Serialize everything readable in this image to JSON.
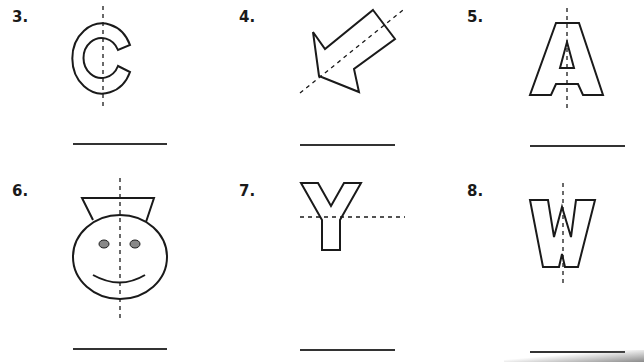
{
  "worksheet": {
    "problems": [
      {
        "number": "3.",
        "figure": "letter-C",
        "line_of_symmetry": "vertical"
      },
      {
        "number": "4.",
        "figure": "arrow",
        "line_of_symmetry": "diagonal"
      },
      {
        "number": "5.",
        "figure": "letter-A",
        "line_of_symmetry": "vertical"
      },
      {
        "number": "6.",
        "figure": "face-with-hat",
        "line_of_symmetry": "vertical"
      },
      {
        "number": "7.",
        "figure": "letter-Y",
        "line_of_symmetry": "horizontal"
      },
      {
        "number": "8.",
        "figure": "letter-W",
        "line_of_symmetry": "vertical"
      }
    ],
    "answer_line_placeholder": "",
    "colors": {
      "stroke": "#1a1a1a",
      "eye_fill": "#888888",
      "line": "#333333"
    }
  }
}
